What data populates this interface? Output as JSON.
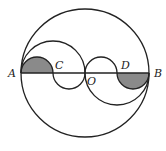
{
  "diagram": {
    "type": "geometry",
    "labels": {
      "A": "A",
      "B": "B",
      "C": "C",
      "D": "D",
      "O": "O"
    },
    "colors": {
      "stroke": "#222222",
      "shade": "#8a8a8a",
      "background": "#ffffff"
    },
    "points": {
      "A": [
        21,
        73
      ],
      "C": [
        53,
        73
      ],
      "O": [
        85,
        73
      ],
      "D": [
        117,
        73
      ],
      "B": [
        149,
        73
      ]
    },
    "big_circle": {
      "center": [
        85,
        73
      ],
      "radius": 64
    }
  }
}
